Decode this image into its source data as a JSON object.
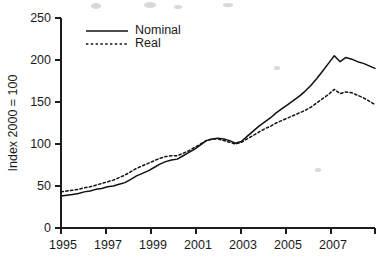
{
  "chart_data": {
    "type": "line",
    "title": "",
    "subtitle": "",
    "xlabel": "",
    "ylabel": "Index 2000 = 100",
    "xlim": [
      1995,
      2008.5
    ],
    "ylim": [
      0,
      250
    ],
    "grid": false,
    "legend_position": "top-left-inside",
    "y_ticks": [
      0,
      50,
      100,
      150,
      200,
      250
    ],
    "y_tick_labels": [
      "0",
      "50",
      "100",
      "150",
      "200",
      "250"
    ],
    "x_ticks": [
      1995,
      1997,
      1999,
      2001,
      2003,
      2005,
      2007
    ],
    "x_tick_labels": [
      "1995",
      "1997",
      "1999",
      "2001",
      "2003",
      "2005",
      "2007"
    ],
    "x_minor_ticks": [
      1996,
      1998,
      2000,
      2002,
      2004,
      2006,
      2008
    ],
    "series": [
      {
        "name": "Nominal",
        "style": "solid",
        "color": "#111111",
        "x": [
          1995,
          1995.25,
          1995.5,
          1995.75,
          1996,
          1996.25,
          1996.5,
          1996.75,
          1997,
          1997.25,
          1997.5,
          1997.75,
          1998,
          1998.25,
          1998.5,
          1998.75,
          1999,
          1999.25,
          1999.5,
          1999.75,
          2000,
          2000.25,
          2000.5,
          2000.75,
          2001,
          2001.25,
          2001.5,
          2001.75,
          2002,
          2002.25,
          2002.5,
          2002.75,
          2003,
          2003.25,
          2003.5,
          2003.75,
          2004,
          2004.25,
          2004.5,
          2004.75,
          2005,
          2005.25,
          2005.5,
          2005.75,
          2006,
          2006.25,
          2006.5,
          2006.75,
          2007,
          2007.25,
          2007.5,
          2007.75,
          2008,
          2008.25,
          2008.5
        ],
        "values": [
          38,
          39,
          40,
          41,
          43,
          44,
          46,
          47,
          49,
          50,
          52,
          54,
          58,
          62,
          65,
          68,
          72,
          76,
          79,
          81,
          82,
          86,
          90,
          94,
          99,
          104,
          106,
          107,
          106,
          104,
          101,
          103,
          109,
          115,
          121,
          126,
          131,
          137,
          142,
          147,
          152,
          157,
          163,
          170,
          178,
          187,
          196,
          205,
          198,
          203,
          201,
          198,
          196,
          193,
          190
        ]
      },
      {
        "name": "Real",
        "style": "dotted",
        "color": "#111111",
        "x": [
          1995,
          1995.25,
          1995.5,
          1995.75,
          1996,
          1996.25,
          1996.5,
          1996.75,
          1997,
          1997.25,
          1997.5,
          1997.75,
          1998,
          1998.25,
          1998.5,
          1998.75,
          1999,
          1999.25,
          1999.5,
          1999.75,
          2000,
          2000.25,
          2000.5,
          2000.75,
          2001,
          2001.25,
          2001.5,
          2001.75,
          2002,
          2002.25,
          2002.5,
          2002.75,
          2003,
          2003.25,
          2003.5,
          2003.75,
          2004,
          2004.25,
          2004.5,
          2004.75,
          2005,
          2005.25,
          2005.5,
          2005.75,
          2006,
          2006.25,
          2006.5,
          2006.75,
          2007,
          2007.25,
          2007.5,
          2007.75,
          2008,
          2008.25,
          2008.5
        ],
        "values": [
          43,
          44,
          45,
          46,
          48,
          49,
          51,
          53,
          55,
          57,
          60,
          63,
          67,
          71,
          74,
          77,
          80,
          83,
          85,
          86,
          86,
          89,
          92,
          96,
          100,
          104,
          106,
          106,
          104,
          102,
          100,
          102,
          106,
          110,
          114,
          118,
          121,
          125,
          128,
          131,
          134,
          137,
          140,
          144,
          149,
          154,
          159,
          165,
          160,
          162,
          161,
          158,
          155,
          151,
          147
        ]
      }
    ],
    "annotations": {
      "nominal_peak": {
        "x": 2006.75,
        "y": 205
      },
      "real_peak": {
        "x": 2006.75,
        "y": 165
      },
      "trough_2002": {
        "x": 2002.5,
        "y": 101
      }
    }
  },
  "legend": {
    "entries": [
      {
        "label": "Nominal",
        "style": "solid"
      },
      {
        "label": "Real",
        "style": "dotted"
      }
    ]
  },
  "axes": {
    "y_title": "Index 2000 = 100"
  }
}
